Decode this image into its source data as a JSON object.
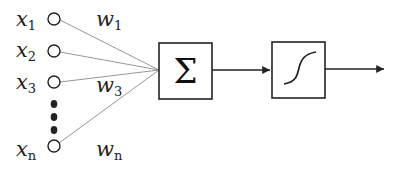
{
  "diagram": {
    "type": "perceptron",
    "inputs": [
      {
        "var": "x",
        "sub": "1",
        "weight_var": "w",
        "weight_sub": "1"
      },
      {
        "var": "x",
        "sub": "2"
      },
      {
        "var": "x",
        "sub": "3",
        "weight_var": "w",
        "weight_sub": "3"
      },
      {
        "var": "x",
        "sub": "n",
        "weight_var": "w",
        "weight_sub": "n"
      }
    ],
    "summation_symbol": "Σ",
    "activation": "sigmoid",
    "colors": {
      "stroke": "#222222",
      "edge": "#8a8a8a",
      "dots": "#222222"
    }
  }
}
